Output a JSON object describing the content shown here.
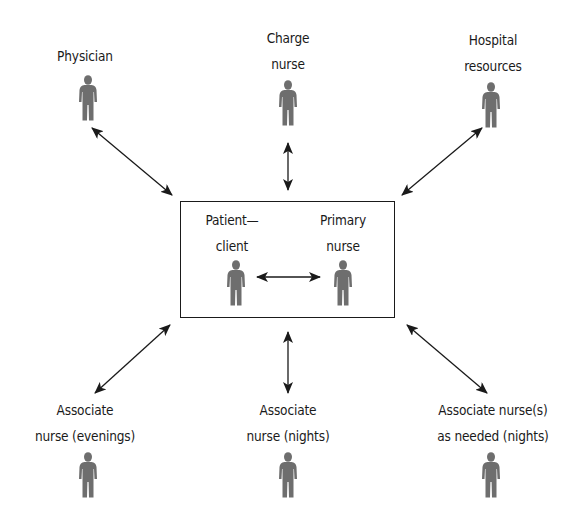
{
  "diagram": {
    "type": "primary-nursing-communication-network",
    "center_box": {
      "nodes": [
        {
          "id": "patient",
          "label_lines": [
            "Patient—",
            "client"
          ]
        },
        {
          "id": "primary",
          "label_lines": [
            "Primary",
            "nurse"
          ]
        }
      ],
      "internal_edge": {
        "from": "patient",
        "to": "primary",
        "style": "double-arrow"
      }
    },
    "top_nodes": [
      {
        "id": "physician",
        "label_lines": [
          "Physician"
        ]
      },
      {
        "id": "charge",
        "label_lines": [
          "Charge",
          "nurse"
        ]
      },
      {
        "id": "hospital",
        "label_lines": [
          "Hospital",
          "resources"
        ]
      }
    ],
    "bottom_nodes": [
      {
        "id": "assoc_evenings",
        "label_lines": [
          "Associate",
          "nurse (evenings)"
        ]
      },
      {
        "id": "assoc_nights",
        "label_lines": [
          "Associate",
          "nurse (nights)"
        ]
      },
      {
        "id": "assoc_needed",
        "label_lines": [
          "Associate nurse(s)",
          "as needed (nights)"
        ]
      }
    ],
    "edges": [
      {
        "from": "physician",
        "to": "center_box",
        "style": "double-arrow"
      },
      {
        "from": "charge",
        "to": "center_box",
        "style": "double-arrow"
      },
      {
        "from": "hospital",
        "to": "center_box",
        "style": "double-arrow"
      },
      {
        "from": "assoc_evenings",
        "to": "center_box",
        "style": "double-arrow"
      },
      {
        "from": "assoc_nights",
        "to": "center_box",
        "style": "double-arrow"
      },
      {
        "from": "assoc_needed",
        "to": "center_box",
        "style": "double-arrow"
      }
    ],
    "icon": "person-icon",
    "colors": {
      "line": "#1a1a1a",
      "figure": "#6e6e6e",
      "background": "#ffffff"
    }
  }
}
